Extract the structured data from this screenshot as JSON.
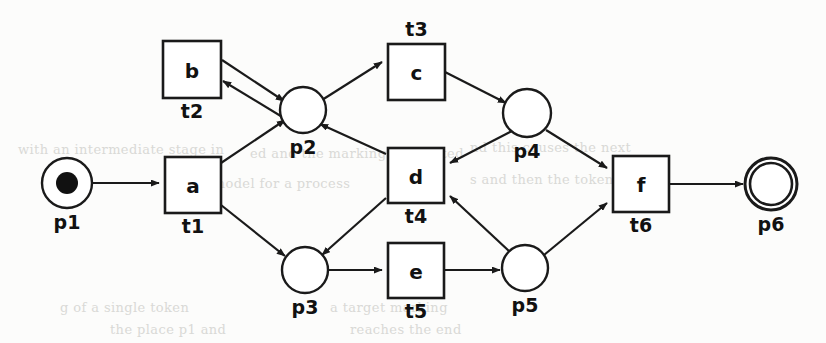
{
  "diagram": {
    "type": "petri-net",
    "title": "",
    "colors": {
      "stroke": "#1a1a1a",
      "fill": "#ffffff",
      "token": "#111111",
      "background": "#fcfcfb",
      "bleed_text": "#d9d9d6"
    },
    "places": [
      {
        "id": "p1",
        "label": "p1",
        "cx": 67,
        "cy": 183,
        "r": 25,
        "tokens": 1,
        "final": false
      },
      {
        "id": "p2",
        "label": "p2",
        "cx": 303,
        "cy": 110,
        "r": 23,
        "tokens": 0,
        "final": false
      },
      {
        "id": "p3",
        "label": "p3",
        "cx": 305,
        "cy": 270,
        "r": 23,
        "tokens": 0,
        "final": false
      },
      {
        "id": "p4",
        "label": "p4",
        "cx": 527,
        "cy": 113,
        "r": 24,
        "tokens": 0,
        "final": false
      },
      {
        "id": "p5",
        "label": "p5",
        "cx": 525,
        "cy": 268,
        "r": 23,
        "tokens": 0,
        "final": false
      },
      {
        "id": "p6",
        "label": "p6",
        "cx": 771,
        "cy": 184,
        "r": 26,
        "tokens": 0,
        "final": true
      }
    ],
    "transitions": [
      {
        "id": "t1",
        "activity": "a",
        "name": "t1",
        "x": 165,
        "y": 157,
        "w": 56,
        "h": 56,
        "name_pos": "below"
      },
      {
        "id": "t2",
        "activity": "b",
        "name": "t2",
        "x": 163,
        "y": 41,
        "w": 58,
        "h": 57,
        "name_pos": "below"
      },
      {
        "id": "t3",
        "activity": "c",
        "name": "t3",
        "x": 388,
        "y": 44,
        "w": 57,
        "h": 56,
        "name_pos": "above"
      },
      {
        "id": "t4",
        "activity": "d",
        "name": "t4",
        "x": 388,
        "y": 148,
        "w": 56,
        "h": 55,
        "name_pos": "below"
      },
      {
        "id": "t5",
        "activity": "e",
        "name": "t5",
        "x": 388,
        "y": 243,
        "w": 56,
        "h": 55,
        "name_pos": "below"
      },
      {
        "id": "t6",
        "activity": "f",
        "name": "t6",
        "x": 613,
        "y": 156,
        "w": 56,
        "h": 56,
        "name_pos": "below"
      }
    ],
    "arcs": [
      {
        "from": "p1",
        "to": "t1",
        "d": "M 92 183 L 159 183"
      },
      {
        "from": "t1",
        "to": "p2",
        "d": "M 221 163 L 285 120"
      },
      {
        "from": "t1",
        "to": "p3",
        "d": "M 221 205 L 285 256"
      },
      {
        "from": "t2",
        "to": "p2",
        "d": "M 222 60 L 284 101"
      },
      {
        "from": "p2",
        "to": "t2",
        "d": "M 284 118 L 223 81"
      },
      {
        "from": "p2",
        "to": "t3",
        "d": "M 322 100 L 382 62"
      },
      {
        "from": "t3",
        "to": "p4",
        "d": "M 445 72 L 506 103"
      },
      {
        "from": "p4",
        "to": "t4",
        "d": "M 512 131 L 450 163"
      },
      {
        "from": "t4",
        "to": "p2",
        "d": "M 386 154 L 320 124"
      },
      {
        "from": "t4",
        "to": "p3",
        "d": "M 386 198 L 322 255"
      },
      {
        "from": "p5",
        "to": "t4",
        "d": "M 510 252 L 450 196"
      },
      {
        "from": "p3",
        "to": "t5",
        "d": "M 328 270 L 382 270"
      },
      {
        "from": "t5",
        "to": "p5",
        "d": "M 444 270 L 500 270"
      },
      {
        "from": "p4",
        "to": "t6",
        "d": "M 546 130 L 607 168"
      },
      {
        "from": "p5",
        "to": "t6",
        "d": "M 544 255 L 607 203"
      },
      {
        "from": "t6",
        "to": "p6",
        "d": "M 669 184 L 743 184"
      }
    ],
    "bleed_lines": [
      {
        "text": "with an intermediate stage in",
        "x": 18,
        "y": 142,
        "size": 13
      },
      {
        "text": "ed and the marking is updated",
        "x": 250,
        "y": 146,
        "size": 13
      },
      {
        "text": "nd this causes the next",
        "x": 470,
        "y": 140,
        "size": 13
      },
      {
        "text": "a model for a process",
        "x": 200,
        "y": 176,
        "size": 13
      },
      {
        "text": "s and then the token",
        "x": 470,
        "y": 172,
        "size": 13
      },
      {
        "text": "g of a single token",
        "x": 60,
        "y": 300,
        "size": 13
      },
      {
        "text": "the place p1 and",
        "x": 110,
        "y": 322,
        "size": 13
      },
      {
        "text": "a target marking",
        "x": 330,
        "y": 300,
        "size": 13
      },
      {
        "text": "reaches the end",
        "x": 350,
        "y": 322,
        "size": 13
      }
    ]
  }
}
